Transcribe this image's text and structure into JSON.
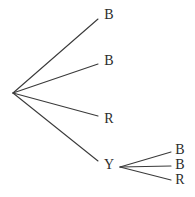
{
  "diagram": {
    "type": "tree",
    "stroke_color": "#3a3a3a",
    "text_color": "#2b2b2b",
    "background_color": "#ffffff",
    "root": {
      "x": 13,
      "y": 93,
      "label": ""
    },
    "level1": {
      "branch_count": 4,
      "nodes": [
        {
          "id": "n1",
          "label": "B",
          "x": 109,
          "y": 16,
          "line_end_x": 98,
          "line_end_y": 19
        },
        {
          "id": "n2",
          "label": "B",
          "x": 109,
          "y": 62,
          "line_end_x": 98,
          "line_end_y": 64
        },
        {
          "id": "n3",
          "label": "R",
          "x": 109,
          "y": 120,
          "line_end_x": 98,
          "line_end_y": 116
        },
        {
          "id": "n4",
          "label": "Y",
          "x": 109,
          "y": 166,
          "line_end_x": 98,
          "line_end_y": 161
        }
      ]
    },
    "subtree": {
      "parent": "n4",
      "vertex": {
        "x": 120,
        "y": 167
      },
      "branch_count": 3,
      "nodes": [
        {
          "id": "s1",
          "label": "B",
          "x": 180,
          "y": 151,
          "line_end_x": 171,
          "line_end_y": 152
        },
        {
          "id": "s2",
          "label": "B",
          "x": 180,
          "y": 166,
          "line_end_x": 171,
          "line_end_y": 166
        },
        {
          "id": "s3",
          "label": "R",
          "x": 180,
          "y": 181,
          "line_end_x": 171,
          "line_end_y": 180
        }
      ]
    }
  }
}
